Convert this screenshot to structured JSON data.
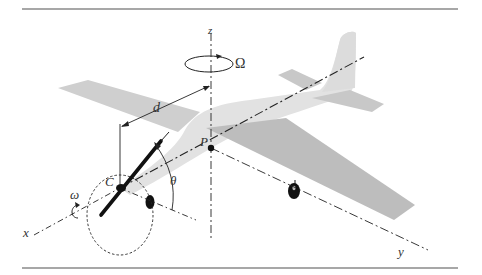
{
  "figure": {
    "type": "diagram",
    "labels": {
      "z_axis": "z",
      "x_axis": "x",
      "y_axis": "y",
      "omega_upper": "Ω",
      "omega_lower": "ω",
      "distance": "d",
      "point_p": "P",
      "point_c": "C",
      "angle": "θ"
    },
    "colors": {
      "rule": "#8a8a8a",
      "fuselage": "#e2e2e2",
      "wing": "#cfcfcf",
      "wing_dark": "#bdbdbd",
      "ink": "#222222"
    }
  }
}
